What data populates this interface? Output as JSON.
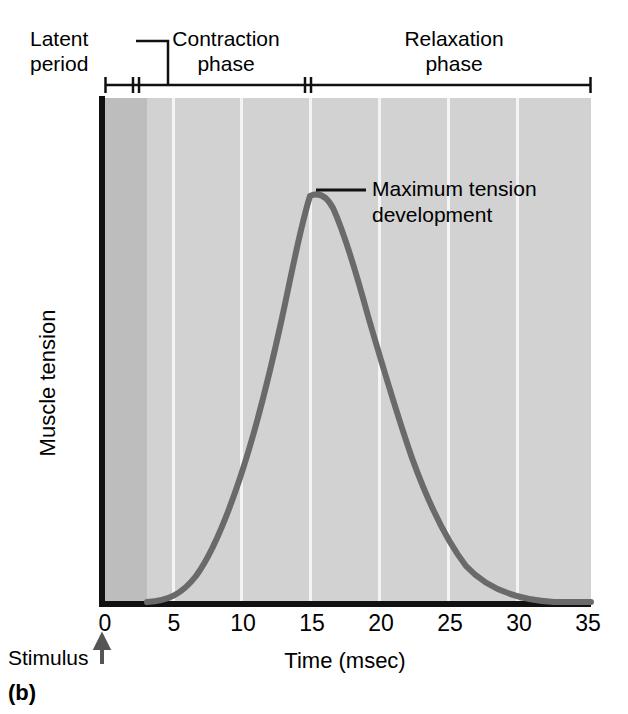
{
  "panel": {
    "label": "(b)"
  },
  "brackets": {
    "latent": {
      "label": "Latent\nperiod",
      "start_msec": 0,
      "end_msec": 3
    },
    "contraction": {
      "label": "Contraction\nphase",
      "start_msec": 3,
      "end_msec": 15
    },
    "relaxation": {
      "label": "Relaxation\nphase",
      "start_msec": 15,
      "end_msec": 35
    }
  },
  "annotation": {
    "text": "Maximum tension\ndevelopment",
    "points_to_msec": 15
  },
  "axes": {
    "x_title": "Time (msec)",
    "y_title": "Muscle tension",
    "stimulus_label": "Stimulus",
    "stimulus_icon": "up-arrow-icon",
    "x_ticks": [
      "0",
      "5",
      "10",
      "15",
      "20",
      "25",
      "30",
      "35"
    ]
  },
  "colors": {
    "plot_background": "#d2d2d2",
    "latent_band": "#bdbdbd",
    "gridline": "#f4f4f4",
    "curve": "#6a6a6a",
    "axis": "#111111",
    "text": "#000000"
  },
  "chart_data": {
    "type": "line",
    "title": "",
    "xlabel": "Time (msec)",
    "ylabel": "Muscle tension",
    "xlim": [
      0,
      35
    ],
    "ylim": [
      0,
      1.05
    ],
    "grid": true,
    "legend": false,
    "x_ticks": [
      0,
      5,
      10,
      15,
      20,
      25,
      30,
      35
    ],
    "y_ticks": [],
    "annotations": [
      {
        "text": "Latent period",
        "x_range": [
          0,
          3
        ]
      },
      {
        "text": "Contraction phase",
        "x_range": [
          3,
          15
        ]
      },
      {
        "text": "Relaxation phase",
        "x_range": [
          15,
          35
        ]
      },
      {
        "text": "Maximum tension development",
        "x": 15,
        "y": 1.0
      },
      {
        "text": "Stimulus",
        "x": 0,
        "y": 0
      }
    ],
    "series": [
      {
        "name": "Muscle tension",
        "x": [
          0,
          1,
          2,
          3,
          4,
          5,
          6,
          7,
          8,
          9,
          10,
          11,
          12,
          13,
          14,
          15,
          16,
          17,
          18,
          19,
          20,
          21,
          22,
          23,
          24,
          25,
          26,
          27,
          28,
          29,
          30,
          31,
          32,
          33,
          34,
          35
        ],
        "values": [
          0,
          0,
          0,
          0.005,
          0.02,
          0.05,
          0.1,
          0.18,
          0.29,
          0.43,
          0.57,
          0.71,
          0.83,
          0.92,
          0.98,
          1.0,
          0.985,
          0.95,
          0.89,
          0.82,
          0.73,
          0.64,
          0.55,
          0.46,
          0.38,
          0.3,
          0.23,
          0.17,
          0.12,
          0.085,
          0.055,
          0.035,
          0.02,
          0.01,
          0.004,
          0.0
        ]
      }
    ]
  }
}
